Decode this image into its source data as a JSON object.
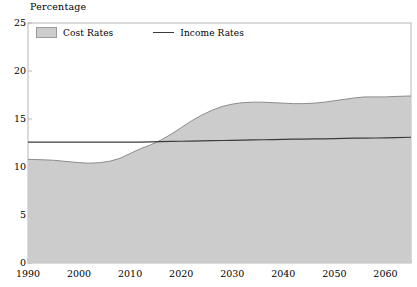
{
  "chart_data": {
    "type": "area",
    "title": "Percentage",
    "xlabel": "",
    "ylabel": "Percentage",
    "xlim": [
      1990,
      2065
    ],
    "ylim": [
      0,
      25
    ],
    "yticks": [
      0,
      5,
      10,
      15,
      20,
      25
    ],
    "xticks": [
      1990,
      2000,
      2010,
      2020,
      2030,
      2040,
      2050,
      2060
    ],
    "xminor_step": 5,
    "grid": false,
    "legend_position": "top-left-inside",
    "legend": [
      "Cost Rates",
      "Income Rates"
    ],
    "colors": {
      "cost_fill": "#cccccc",
      "cost_edge": "#8c8c8c",
      "income_line": "#3b3b3b",
      "axis": "#b8b8b8",
      "text": "#000000"
    },
    "x": [
      1990,
      1993,
      1995,
      1997,
      2000,
      2002,
      2004,
      2006,
      2008,
      2010,
      2012,
      2014,
      2016,
      2018,
      2020,
      2022,
      2024,
      2026,
      2028,
      2030,
      2032,
      2034,
      2036,
      2038,
      2040,
      2042,
      2044,
      2046,
      2048,
      2050,
      2052,
      2054,
      2056,
      2058,
      2060,
      2062,
      2065
    ],
    "series": [
      {
        "name": "Cost Rates",
        "type": "area",
        "values": [
          10.8,
          10.75,
          10.7,
          10.6,
          10.45,
          10.4,
          10.45,
          10.6,
          10.9,
          11.4,
          11.9,
          12.3,
          12.8,
          13.4,
          14.1,
          14.8,
          15.4,
          15.9,
          16.3,
          16.55,
          16.7,
          16.75,
          16.75,
          16.7,
          16.65,
          16.6,
          16.6,
          16.65,
          16.75,
          16.9,
          17.05,
          17.2,
          17.3,
          17.3,
          17.3,
          17.35,
          17.4
        ]
      },
      {
        "name": "Income Rates",
        "type": "line",
        "values": [
          12.6,
          12.6,
          12.6,
          12.6,
          12.6,
          12.6,
          12.6,
          12.6,
          12.6,
          12.6,
          12.6,
          12.62,
          12.64,
          12.66,
          12.68,
          12.7,
          12.72,
          12.74,
          12.76,
          12.78,
          12.8,
          12.82,
          12.84,
          12.86,
          12.88,
          12.9,
          12.9,
          12.92,
          12.94,
          12.96,
          12.98,
          13.0,
          13.0,
          13.02,
          13.04,
          13.06,
          13.1
        ]
      }
    ],
    "annotations": {
      "crossover_year": 2016,
      "crossover_value": 12.7
    }
  }
}
